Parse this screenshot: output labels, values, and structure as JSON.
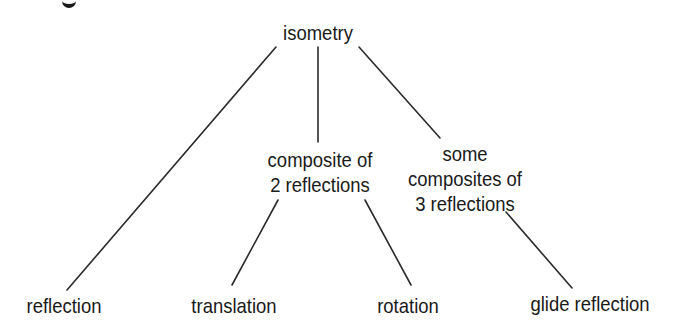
{
  "diagram": {
    "type": "tree",
    "root": {
      "id": "isometry",
      "label": "isometry",
      "children": [
        {
          "id": "reflection",
          "label": "reflection"
        },
        {
          "id": "composite2",
          "label_lines": [
            "composite of",
            "2 reflections"
          ],
          "children": [
            {
              "id": "translation",
              "label": "translation"
            },
            {
              "id": "rotation",
              "label": "rotation"
            }
          ]
        },
        {
          "id": "composite3",
          "label_lines": [
            "some",
            "composites of",
            "3 reflections"
          ],
          "children": [
            {
              "id": "glide",
              "label": "glide reflection"
            }
          ]
        }
      ]
    },
    "nodes": {
      "isometry": "isometry",
      "composite2_line1": "composite of",
      "composite2_line2": "2 reflections",
      "composite3_line1": "some",
      "composite3_line2": "composites of",
      "composite3_line3": "3 reflections",
      "reflection": "reflection",
      "translation": "translation",
      "rotation": "rotation",
      "glide": "glide reflection"
    },
    "edges": [
      {
        "from": "isometry",
        "to": "reflection",
        "x1": 276,
        "y1": 47,
        "x2": 67,
        "y2": 290
      },
      {
        "from": "isometry",
        "to": "composite2",
        "x1": 318,
        "y1": 47,
        "x2": 318,
        "y2": 142
      },
      {
        "from": "isometry",
        "to": "composite3",
        "x1": 359,
        "y1": 47,
        "x2": 440,
        "y2": 138
      },
      {
        "from": "composite2",
        "to": "translation",
        "x1": 278,
        "y1": 200,
        "x2": 232,
        "y2": 285
      },
      {
        "from": "composite2",
        "to": "rotation",
        "x1": 365,
        "y1": 200,
        "x2": 411,
        "y2": 285
      },
      {
        "from": "composite3",
        "to": "glide",
        "x1": 506,
        "y1": 212,
        "x2": 572,
        "y2": 288
      }
    ],
    "line_color": "#2a2a2a"
  }
}
